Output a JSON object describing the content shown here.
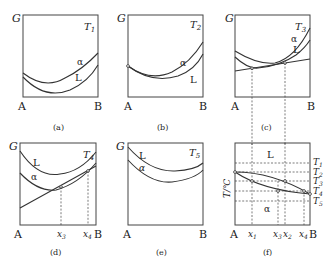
{
  "figure": {
    "axis_labels": {
      "G": "G",
      "A": "A",
      "B": "B",
      "T_axis": "T/℃"
    },
    "panels": [
      {
        "id": "a",
        "caption": "(a)",
        "temperature": "T",
        "temp_sub": "1",
        "curves": [
          "α",
          "L"
        ]
      },
      {
        "id": "b",
        "caption": "(b)",
        "temperature": "T",
        "temp_sub": "2",
        "curves": [
          "α",
          "L"
        ]
      },
      {
        "id": "c",
        "caption": "(c)",
        "temperature": "T",
        "temp_sub": "3",
        "curves": [
          "α",
          "L"
        ]
      },
      {
        "id": "d",
        "caption": "(d)",
        "temperature": "T",
        "temp_sub": "4",
        "curves": [
          "L",
          "α"
        ],
        "x_marks": [
          "x",
          "x"
        ],
        "x_subs": [
          "3",
          "4"
        ]
      },
      {
        "id": "e",
        "caption": "(e)",
        "temperature": "T",
        "temp_sub": "5",
        "curves": [
          "L",
          "α"
        ]
      },
      {
        "id": "f",
        "caption": "(f)",
        "region_labels": [
          "L",
          "α"
        ],
        "temps": [
          {
            "t": "T",
            "s": "1"
          },
          {
            "t": "T",
            "s": "2"
          },
          {
            "t": "T",
            "s": "3"
          },
          {
            "t": "T",
            "s": "4"
          },
          {
            "t": "T",
            "s": "5"
          }
        ],
        "x_marks": [
          {
            "t": "x",
            "s": "1"
          },
          {
            "t": "x",
            "s": "3"
          },
          {
            "t": "x",
            "s": "2"
          },
          {
            "t": "x",
            "s": "4"
          }
        ]
      }
    ]
  }
}
